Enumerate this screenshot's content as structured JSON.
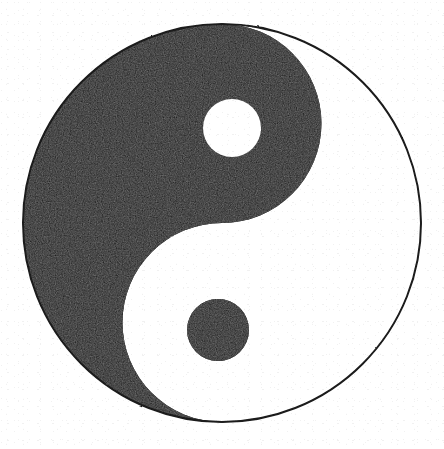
{
  "image": {
    "title": "Yin and Yang Symbol",
    "subject": "taijitu",
    "alt_text": "Black and white yin-yang (taijitu) symbol on a white background",
    "width": 444,
    "height": 449,
    "background_color": "#ffffff",
    "rendering_note": "scanned line art, grainy black fill"
  },
  "colors": {
    "yin_black": "#151515",
    "yang_white": "#ffffff",
    "outline_black": "#1a1a1a",
    "page_white": "#ffffff"
  },
  "geometry": {
    "outer_circle": {
      "label": "outer-circle",
      "center_x": 222,
      "center_y": 223,
      "radius": 199,
      "stroke_width": 2
    },
    "s_curve": {
      "label": "s-curve-divider",
      "upper_lobe_center_x": 222,
      "upper_lobe_center_y": 128,
      "upper_lobe_radius": 99,
      "lower_lobe_center_x": 222,
      "lower_lobe_center_y": 322,
      "lower_lobe_radius": 99
    },
    "yang_dot": {
      "label": "white-dot",
      "center_x": 232,
      "center_y": 128,
      "radius": 29,
      "fill": "#ffffff"
    },
    "yin_dot": {
      "label": "black-dot",
      "center_x": 218,
      "center_y": 330,
      "radius": 31,
      "fill": "#151515"
    }
  },
  "regions": [
    {
      "name": "yin",
      "label": "Yin (dark half)",
      "position": "upper-left",
      "fill": "#151515"
    },
    {
      "name": "yang",
      "label": "Yang (light half)",
      "position": "lower-right",
      "fill": "#ffffff"
    }
  ]
}
